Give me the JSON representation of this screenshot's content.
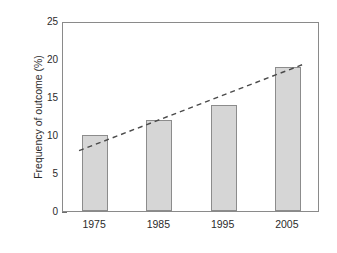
{
  "chart_data": {
    "type": "bar",
    "title": "",
    "xlabel": "",
    "ylabel": "Frequency of outcome (%)",
    "categories": [
      "1975",
      "1985",
      "1995",
      "2005"
    ],
    "values": [
      10,
      12,
      14,
      19
    ],
    "ylim": [
      0,
      25
    ],
    "yticks": [
      0,
      5,
      10,
      15,
      20,
      25
    ],
    "ytick_labels": [
      "0",
      "5",
      "10",
      "15",
      "20",
      "25"
    ],
    "grid": false,
    "legend": null,
    "series": [
      {
        "name": "Frequency of outcome",
        "type": "bar",
        "values": [
          10,
          12,
          14,
          19
        ]
      },
      {
        "name": "Trend line",
        "type": "line",
        "style": "dashed",
        "x": [
          1972.5,
          2007.5
        ],
        "y": [
          8.2,
          19.6
        ]
      }
    ],
    "colors": {
      "bar_fill": "#d6d6d6",
      "bar_edge": "#8c8c8c",
      "axis": "#8a8a8a",
      "text": "#2b2b2b",
      "trend_line": "#4a4a4a"
    }
  }
}
